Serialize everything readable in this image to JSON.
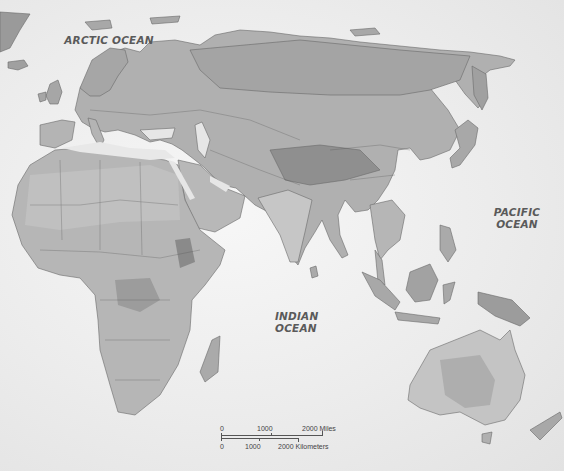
{
  "map": {
    "type": "physical-political",
    "region": "Eastern Hemisphere",
    "colors": {
      "ocean": "#ececec",
      "land_base": "#b0b0b0",
      "land_light": "#c8c8c8",
      "land_dark": "#8a8a8a",
      "border": "#555555",
      "label": "#5a5a5a"
    },
    "labels": {
      "arctic": "ARCTIC OCEAN",
      "pacific_line1": "PACIFIC",
      "pacific_line2": "OCEAN",
      "indian_line1": "INDIAN",
      "indian_line2": "OCEAN"
    },
    "scale": {
      "miles": {
        "zero": "0",
        "mid": "1000",
        "end": "2000 Miles"
      },
      "km": {
        "zero": "0",
        "mid": "1000",
        "end": "2000 Kilometers"
      }
    }
  }
}
